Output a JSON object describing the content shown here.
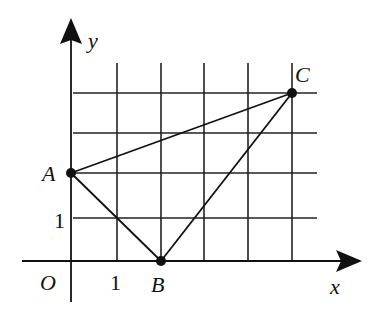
{
  "diagram": {
    "type": "coordinate-grid-triangle",
    "axes": {
      "x_label": "x",
      "y_label": "y",
      "origin_label": "O",
      "x_unit_label": "1",
      "y_unit_label": "1"
    },
    "grid": {
      "x_lines": [
        1,
        2,
        3,
        4,
        5
      ],
      "y_lines": [
        1,
        2,
        3,
        4
      ]
    },
    "points": [
      {
        "name": "A",
        "x": 0,
        "y": 2
      },
      {
        "name": "B",
        "x": 2,
        "y": 0
      },
      {
        "name": "C",
        "x": 5,
        "y": 4
      }
    ],
    "segments": [
      [
        "A",
        "B"
      ],
      [
        "B",
        "C"
      ],
      [
        "C",
        "A"
      ]
    ],
    "colors": {
      "ink": "#111111",
      "background": "#ffffff"
    }
  }
}
